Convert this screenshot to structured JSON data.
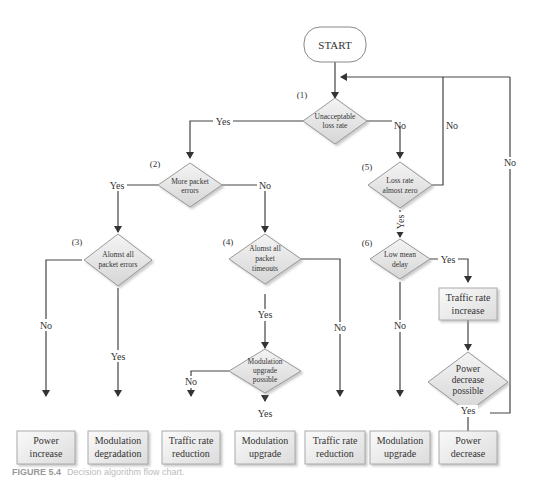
{
  "start": {
    "label": "START"
  },
  "decisions": [
    {
      "id": "1",
      "step": "(1)",
      "lines": [
        "Unacceptable",
        "loss rate"
      ]
    },
    {
      "id": "2",
      "step": "(2)",
      "lines": [
        "More packet",
        "errors"
      ]
    },
    {
      "id": "3",
      "step": "(3)",
      "lines": [
        "Alomst all",
        "packet errors"
      ]
    },
    {
      "id": "4",
      "step": "(4)",
      "lines": [
        "Alomst all",
        "packet",
        "timeouts"
      ]
    },
    {
      "id": "5",
      "step": "(5)",
      "lines": [
        "Loss rate",
        "almost zero"
      ]
    },
    {
      "id": "6",
      "step": "(6)",
      "lines": [
        "Low mean",
        "delay"
      ]
    },
    {
      "id": "m",
      "step": "",
      "lines": [
        "Modulation",
        "upgrade",
        "possible"
      ]
    },
    {
      "id": "p",
      "step": "",
      "lines": [
        "Power",
        "decrease",
        "possible"
      ]
    }
  ],
  "actions": [
    {
      "id": "power-increase",
      "lines": [
        "Power",
        "increase"
      ]
    },
    {
      "id": "modulation-degradation",
      "lines": [
        "Modulation",
        "degradation"
      ]
    },
    {
      "id": "traffic-rate-reduction-1",
      "lines": [
        "Traffic rate",
        "reduction"
      ]
    },
    {
      "id": "modulation-upgrade-1",
      "lines": [
        "Modulation",
        "upgrade"
      ]
    },
    {
      "id": "traffic-rate-reduction-2",
      "lines": [
        "Traffic rate",
        "reduction"
      ]
    },
    {
      "id": "modulation-upgrade-2",
      "lines": [
        "Modulation",
        "upgrade"
      ]
    },
    {
      "id": "power-decrease",
      "lines": [
        "Power",
        "decrease"
      ]
    },
    {
      "id": "traffic-rate-increase",
      "lines": [
        "Traffic rate",
        "increase"
      ]
    }
  ],
  "edge_labels": {
    "yes": "Yes",
    "no": "No"
  },
  "caption": {
    "figure": "FIGURE 5.4",
    "text": "Decision algorithm flow chart."
  }
}
